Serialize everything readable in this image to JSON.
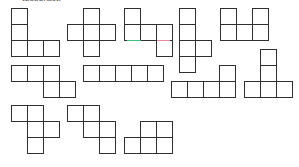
{
  "caption": "tesseract.",
  "cell_size": 16,
  "colors": {
    "line": "#2f2f2f",
    "accent_green": "#3fbf7f",
    "accent_red": "#e88a9a"
  },
  "nets": [
    {
      "id": "net-1",
      "cells": [
        [
          11,
          8
        ],
        [
          11,
          24
        ],
        [
          11,
          40
        ],
        [
          27,
          40
        ],
        [
          43,
          40
        ]
      ]
    },
    {
      "id": "net-2",
      "cells": [
        [
          83,
          8
        ],
        [
          67,
          24
        ],
        [
          83,
          24
        ],
        [
          99,
          24
        ],
        [
          83,
          40
        ]
      ]
    },
    {
      "id": "net-3",
      "cells": [
        [
          124,
          8
        ],
        [
          124,
          24
        ],
        [
          140,
          24
        ],
        [
          156,
          24
        ],
        [
          156,
          40
        ]
      ]
    },
    {
      "id": "net-4",
      "cells": [
        [
          179,
          8
        ],
        [
          179,
          24
        ],
        [
          179,
          40
        ],
        [
          179,
          56
        ],
        [
          195,
          40
        ]
      ]
    },
    {
      "id": "net-5",
      "cells": [
        [
          220,
          8
        ],
        [
          252,
          8
        ],
        [
          220,
          24
        ],
        [
          236,
          24
        ],
        [
          252,
          24
        ]
      ]
    },
    {
      "id": "net-6",
      "cells": [
        [
          11,
          65
        ],
        [
          27,
          65
        ],
        [
          43,
          65
        ],
        [
          43,
          81
        ],
        [
          59,
          81
        ]
      ]
    },
    {
      "id": "net-7",
      "cells": [
        [
          83,
          65
        ],
        [
          99,
          65
        ],
        [
          115,
          65
        ],
        [
          131,
          65
        ],
        [
          147,
          65
        ]
      ]
    },
    {
      "id": "net-8",
      "cells": [
        [
          219,
          65
        ],
        [
          171,
          81
        ],
        [
          187,
          81
        ],
        [
          203,
          81
        ],
        [
          219,
          81
        ]
      ]
    },
    {
      "id": "net-9",
      "cells": [
        [
          260,
          49
        ],
        [
          260,
          65
        ],
        [
          244,
          81
        ],
        [
          260,
          81
        ],
        [
          276,
          81
        ]
      ]
    },
    {
      "id": "net-10",
      "cells": [
        [
          11,
          105
        ],
        [
          27,
          105
        ],
        [
          27,
          121
        ],
        [
          43,
          121
        ],
        [
          27,
          137
        ]
      ]
    },
    {
      "id": "net-11",
      "cells": [
        [
          67,
          105
        ],
        [
          83,
          105
        ],
        [
          83,
          121
        ],
        [
          99,
          121
        ],
        [
          99,
          137
        ]
      ]
    },
    {
      "id": "net-12",
      "cells": [
        [
          140,
          121
        ],
        [
          156,
          121
        ],
        [
          124,
          137
        ],
        [
          140,
          137
        ],
        [
          156,
          137
        ]
      ]
    }
  ],
  "highlights": [
    {
      "id": "green-edge",
      "x": 127,
      "y": 39.5,
      "w": 14,
      "color": "#3fbf7f"
    },
    {
      "id": "red-edge",
      "x": 157,
      "y": 39.5,
      "w": 13,
      "color": "#e88a9a"
    }
  ]
}
